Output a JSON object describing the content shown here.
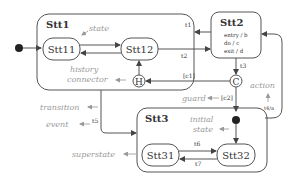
{
  "diagram": {
    "superstates": [
      {
        "name": "Stt1"
      },
      {
        "name": "Stt2",
        "actions": [
          "entry / b",
          "do / c",
          "exit / d"
        ]
      },
      {
        "name": "Stt3"
      }
    ],
    "states": [
      {
        "name": "Stt11"
      },
      {
        "name": "Stt12"
      },
      {
        "name": "Stt31"
      },
      {
        "name": "Stt32"
      }
    ],
    "connectors": {
      "history": "H",
      "condition": "C"
    },
    "transitions": {
      "t1": "t1",
      "t2": "t2",
      "t3": "t3",
      "t5": "t5",
      "t6": "t6",
      "t7": "t7",
      "c1": "[c1]",
      "c2": "[c2]",
      "t4": "t4/a"
    },
    "annotations": {
      "state": "state",
      "history": "history",
      "connector": "connector",
      "transition": "transition",
      "event": "event",
      "superstate": "superstate",
      "guard": "guard",
      "action": "action",
      "initial": "initial",
      "initial_state": "state"
    },
    "colors": {
      "line": "#555555",
      "annotation": "#9a9a9a",
      "dot": "#222222"
    }
  }
}
